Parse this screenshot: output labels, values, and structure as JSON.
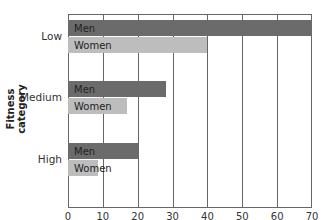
{
  "chart_data": {
    "type": "bar",
    "orientation": "horizontal",
    "title": "",
    "xlabel": "Age-adjusted death rate per 10,000 persons",
    "ylabel": "Fitness category",
    "categories": [
      "Low",
      "Medium",
      "High"
    ],
    "series": [
      {
        "name": "Men",
        "values": [
          70,
          28,
          20
        ],
        "color": "#6b6b6b"
      },
      {
        "name": "Women",
        "values": [
          40,
          17,
          8.5
        ],
        "color": "#bdbdbd"
      }
    ],
    "xlim": [
      0,
      70
    ],
    "xticks": [
      0,
      10,
      20,
      30,
      40,
      50,
      60,
      70
    ],
    "grid": true,
    "legend": "inline bar labels"
  }
}
